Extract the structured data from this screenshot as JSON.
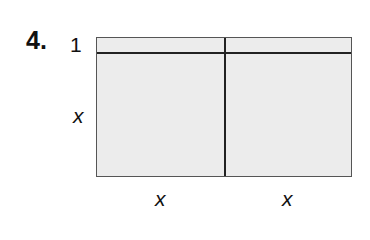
{
  "problem": {
    "number": "4.",
    "labels": {
      "top_row_height": "1",
      "left_height": "x",
      "bottom_left_width": "x",
      "bottom_right_width": "x"
    },
    "diagram": {
      "type": "area model",
      "columns": 2,
      "rows": 2,
      "column_widths": [
        "x",
        "x"
      ],
      "row_heights": [
        "1",
        "x"
      ],
      "fill_color": "#ececec",
      "line_color": "#222222"
    }
  }
}
